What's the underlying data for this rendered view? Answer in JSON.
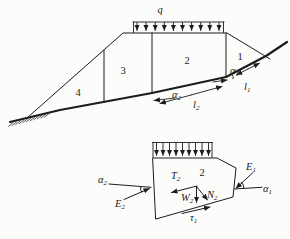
{
  "colors": {
    "ink": "#1c1c1c",
    "paper": "#fcfcfa"
  },
  "top_figure": {
    "load_label": {
      "base": "q",
      "sub": ""
    },
    "slice_labels": {
      "s1": "1",
      "s2": "2",
      "s3": "3",
      "s4": "4"
    },
    "dims": {
      "alpha1": {
        "base": "α",
        "sub": "1"
      },
      "l1": {
        "base": "l",
        "sub": "1"
      },
      "alpha2": {
        "base": "α",
        "sub": "2"
      },
      "l2": {
        "base": "l",
        "sub": "2"
      }
    }
  },
  "bottom_figure": {
    "slice_label": "2",
    "forces": {
      "T2": {
        "base": "T",
        "sub": "2"
      },
      "W2": {
        "base": "W",
        "sub": "2"
      },
      "N2": {
        "base": "N",
        "sub": "2"
      },
      "E1": {
        "base": "E",
        "sub": "1"
      },
      "E2": {
        "base": "E",
        "sub": "2"
      },
      "alpha1": {
        "base": "α",
        "sub": "1"
      },
      "alpha2": {
        "base": "α",
        "sub": "2"
      },
      "tau1": {
        "base": "τ",
        "sub": "1"
      }
    }
  }
}
